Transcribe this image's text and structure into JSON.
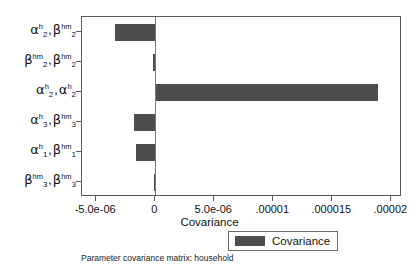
{
  "chart_data": {
    "type": "bar",
    "orientation": "horizontal",
    "title": "",
    "xlabel": "Covariance",
    "ylabel": "",
    "categories": [
      "α^h_2 , β^hm_2",
      "β^hm_2 , β^hm_2",
      "α^h_2 , α^h_2",
      "α^h_3 , β^hm_3",
      "α^h_1 , β^hm_1",
      "β^hm_3 , β^hm_3"
    ],
    "values": [
      -3.4e-06,
      -1.7e-07,
      1.89e-05,
      -1.76e-06,
      -1.6e-06,
      -8e-08
    ],
    "xlim": [
      -6.2e-06,
      2.09e-05
    ],
    "xticks": [
      -5e-06,
      0,
      5e-06,
      1e-05,
      1.5e-05,
      2e-05
    ],
    "xticklabels": [
      "-5.0e-06",
      "0",
      "5.0e-06",
      ".00001",
      ".000015",
      ".00002"
    ],
    "grid": false,
    "legend_position": "bottom-center",
    "series": [
      {
        "name": "Covariance",
        "color": "#4d4d4d"
      }
    ]
  },
  "yaxis": {
    "items": [
      {
        "left_greek": "α",
        "left_sup": "h",
        "left_sub": "2",
        "right_greek": "β",
        "right_sup": "hm",
        "right_sub": "2"
      },
      {
        "left_greek": "β",
        "left_sup": "hm",
        "left_sub": "2",
        "right_greek": "β",
        "right_sup": "hm",
        "right_sub": "2"
      },
      {
        "left_greek": "α",
        "left_sup": "h",
        "left_sub": "2",
        "right_greek": "α",
        "right_sup": "h",
        "right_sub": "2"
      },
      {
        "left_greek": "α",
        "left_sup": "h",
        "left_sub": "3",
        "right_greek": "β",
        "right_sup": "hm",
        "right_sub": "3"
      },
      {
        "left_greek": "α",
        "left_sup": "h",
        "left_sub": "1",
        "right_greek": "β",
        "right_sup": "hm",
        "right_sub": "1"
      },
      {
        "left_greek": "β",
        "left_sup": "hm",
        "left_sub": "3",
        "right_greek": "β",
        "right_sup": "hm",
        "right_sub": "3"
      }
    ],
    "separator": ","
  },
  "legend": {
    "label": "Covariance",
    "swatch_color": "#4d4d4d"
  },
  "caption": {
    "text": "Parameter covariance matrix: household"
  },
  "colors": {
    "bar": "#4d4d4d",
    "frame": "#5a5a5a",
    "zero_line": "#7a7a7a",
    "background": "#ffffff",
    "text": "#111111"
  }
}
